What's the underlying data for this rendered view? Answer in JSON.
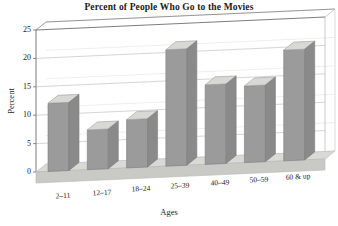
{
  "chart_data": {
    "type": "bar",
    "title": "Percent of People Who Go to the Movies",
    "xlabel": "Ages",
    "ylabel": "Percent",
    "categories": [
      "2–11",
      "12–17",
      "18–24",
      "25–39",
      "40–49",
      "50–59",
      "60 & up"
    ],
    "values": [
      12,
      7,
      8.5,
      20.5,
      14,
      13.5,
      19.5
    ],
    "ylim": [
      0,
      25
    ],
    "yticks": [
      0,
      5,
      10,
      15,
      20,
      25
    ],
    "ytick_labels": [
      "0",
      "5",
      "10",
      "15",
      "20",
      "25"
    ],
    "grid": true,
    "legend": "none",
    "style": "3d-column",
    "colors": {
      "bar_front": "#9b9b9b",
      "bar_top": "#d8d8d6",
      "bar_side": "#8a8a8a",
      "floor": "#d9d9d5",
      "floor_front": "#c9c9c5",
      "grid_line": "#b8b8b8",
      "axis_line": "#6e6e6e",
      "background": "#ffffff",
      "text": "#1a1a1a"
    }
  }
}
